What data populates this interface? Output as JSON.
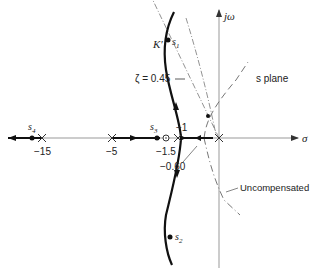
{
  "diagram": {
    "plane_label": "s plane",
    "axes": {
      "real_label": "σ",
      "imag_label": "jω"
    },
    "real_axis_ticks": [
      {
        "value": "-15",
        "label": "−15"
      },
      {
        "value": "-5",
        "label": "−5"
      },
      {
        "value": "-1.5",
        "label": "−1.5"
      },
      {
        "value": "-1",
        "label": "−1"
      },
      {
        "value": "-0.60",
        "label": "−0.60"
      }
    ],
    "points": {
      "s1": {
        "main": "s",
        "sub": "1"
      },
      "s2": {
        "main": "s",
        "sub": "2"
      },
      "s3": {
        "main": "s",
        "sub": "3"
      },
      "s4": {
        "main": "s",
        "sub": "4"
      }
    },
    "gain_label": "K′",
    "damping_label": "ζ = 0.45",
    "uncompensated_label": "Uncompensated",
    "colors": {
      "locus": "#111111",
      "axis": "#888888",
      "dashed": "#666666"
    }
  }
}
